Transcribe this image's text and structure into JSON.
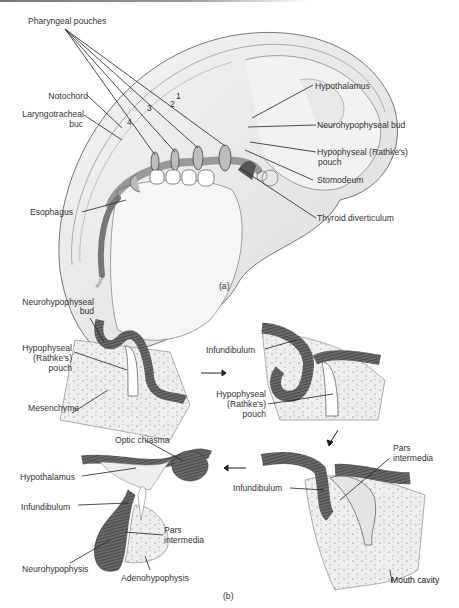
{
  "figure_a": {
    "panel_label": "(a)",
    "labels": {
      "pharyngeal_pouches": "Pharyngeal pouches",
      "notochord": "Notochord",
      "laryngotracheal_1": "Laryngotracheal",
      "laryngotracheal_2": "buc",
      "esophagus": "Esophagus",
      "hypothalamus": "Hypothalamus",
      "neurohypophyseal_bud": "Neurohypophyseal bud",
      "hypophyseal_pouch_1": "Hypophyseal (Rathke's)",
      "hypophyseal_pouch_2": "pouch",
      "stomodeum": "Stomodeum",
      "thyroid_diverticulum": "Thyroid diverticulum"
    },
    "pouch_numbers": [
      "1",
      "2",
      "3",
      "4"
    ]
  },
  "figure_b": {
    "panel_label": "(b)",
    "stage1": {
      "neurohypophyseal_bud_1": "Neurohypophyseal",
      "neurohypophyseal_bud_2": "bud",
      "hypophyseal_1": "Hypophyseal",
      "hypophyseal_2": "(Rathke's)",
      "hypophyseal_3": "pouch",
      "mesenchyme": "Mesenchyme"
    },
    "stage2": {
      "infundibulum": "Infundibulum",
      "hypophyseal_1": "Hypophyseal",
      "hypophyseal_2": "(Rathke's)",
      "hypophyseal_3": "pouch"
    },
    "stage3": {
      "pars_1": "Pars",
      "pars_2": "intermedia",
      "infundibulum": "Infundibulum",
      "mouth_cavity": "Mouth cavity"
    },
    "stage4": {
      "optic_chiasma": "Optic chiasma",
      "hypothalamus": "Hypothalamus",
      "infundibulum": "Infundibulum",
      "pars_1": "Pars",
      "pars_2": "intermedia",
      "neurohypophysis": "Neurohypophysis",
      "adenohypophysis": "Adenohypophysis"
    }
  }
}
